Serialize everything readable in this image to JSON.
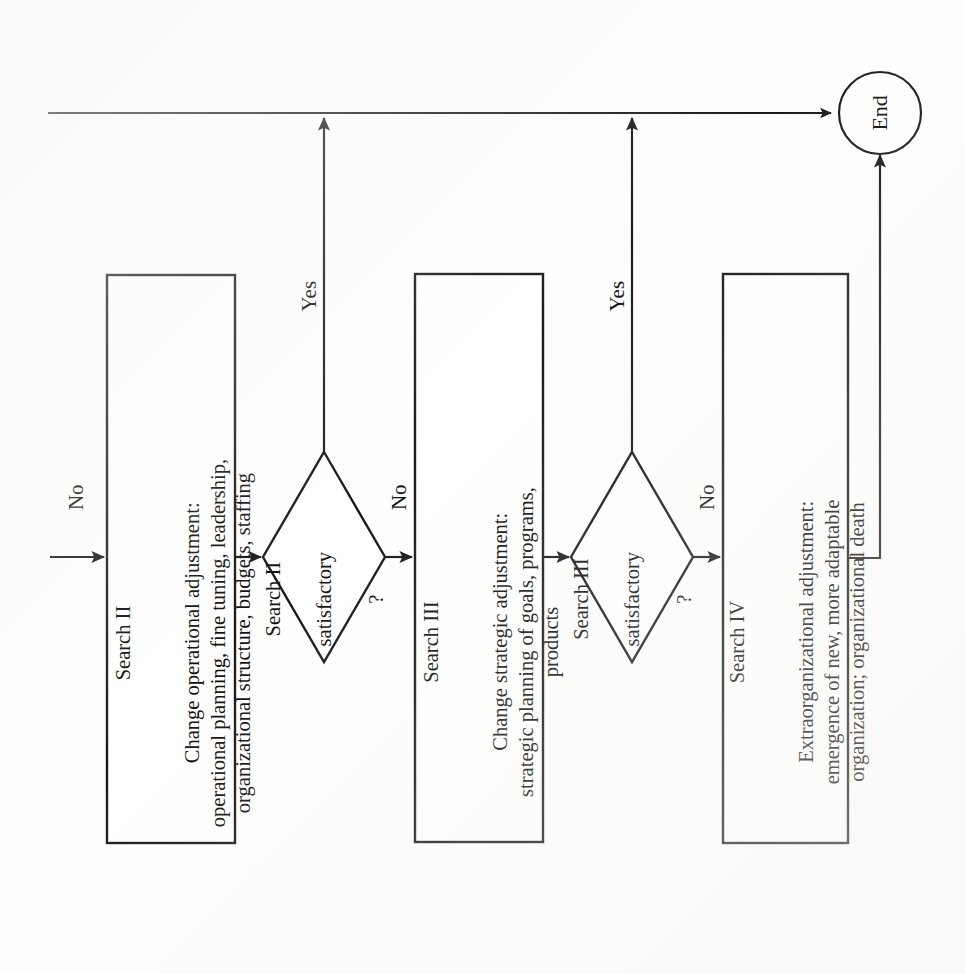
{
  "diagram": {
    "orientation": "rotated-90-ccw",
    "stroke_color": "#1a1a1a",
    "background_color": "#ffffff",
    "nodes": [
      {
        "id": "search2",
        "type": "process",
        "title": "Search II",
        "body": "Change operational adjustment:\noperational planning, fine tuning, leadership,\norganizational structure, budgets, staffing"
      },
      {
        "id": "decision2",
        "type": "decision",
        "line1": "Search II",
        "line2": "satisfactory",
        "line3": "?"
      },
      {
        "id": "search3",
        "type": "process",
        "title": "Search III",
        "body": "Change strategic adjustment:\nstrategic planning of goals, programs,\nproducts"
      },
      {
        "id": "decision3",
        "type": "decision",
        "line1": "Search III",
        "line2": "satisfactory",
        "line3": "?"
      },
      {
        "id": "search4",
        "type": "process",
        "title": "Search IV",
        "body": "Extraorganizational adjustment:\nemergence of new, more adaptable\norganization; organizational death"
      },
      {
        "id": "end",
        "type": "terminator",
        "label": "End"
      }
    ],
    "edge_labels": {
      "entry_no": "No",
      "decision2_no": "No",
      "decision2_yes": "Yes",
      "decision3_no": "No",
      "decision3_yes": "Yes",
      "search4_no": "No"
    }
  }
}
